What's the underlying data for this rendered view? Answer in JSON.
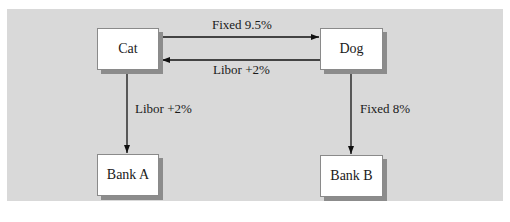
{
  "diagram": {
    "title": "",
    "background_color": "#d9d9d9",
    "nodes": [
      {
        "id": "cat",
        "label": "Cat"
      },
      {
        "id": "dog",
        "label": "Dog"
      },
      {
        "id": "bank_a",
        "label": "Bank A"
      },
      {
        "id": "bank_b",
        "label": "Bank B"
      }
    ],
    "edges": [
      {
        "from": "cat",
        "to": "dog",
        "label": "Fixed 9.5%"
      },
      {
        "from": "dog",
        "to": "cat",
        "label": "Libor +2%"
      },
      {
        "from": "cat",
        "to": "bank_a",
        "label": "Libor +2%"
      },
      {
        "from": "dog",
        "to": "bank_b",
        "label": "Fixed 8%"
      }
    ]
  }
}
